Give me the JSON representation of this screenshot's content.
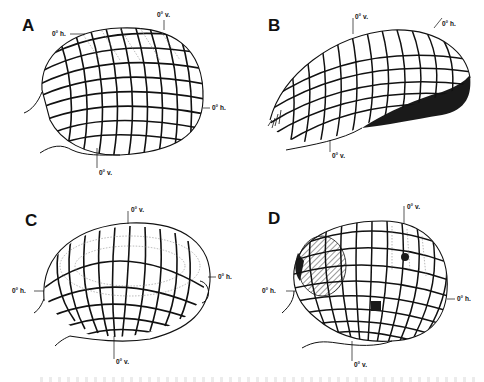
{
  "figure": {
    "panels": [
      {
        "id": "A",
        "letter": "A",
        "labels": {
          "top_v": "0° v.",
          "top_h": "0° h.",
          "right_h": "0° h.",
          "bottom_v": "0° v."
        }
      },
      {
        "id": "B",
        "letter": "B",
        "labels": {
          "top_v": "0° v.",
          "top_h": "0° h.",
          "bottom_v": "0° v."
        }
      },
      {
        "id": "C",
        "letter": "C",
        "labels": {
          "top_v": "0° v.",
          "left_h": "0° h.",
          "right_h": "0° h.",
          "bottom_v": "0° v."
        }
      },
      {
        "id": "D",
        "letter": "D",
        "labels": {
          "top_v": "0° v.",
          "left_h": "0° h.",
          "right_h": "0° h.",
          "bottom_v": "0° v."
        }
      }
    ],
    "colors": {
      "ink": "#111111",
      "dotted": "#888888",
      "fill_dark": "#1a1a1a",
      "hatch": "#333333"
    }
  }
}
